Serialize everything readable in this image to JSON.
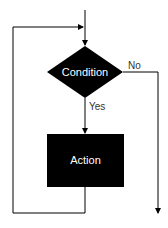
{
  "diagram": {
    "type": "flowchart",
    "nodes": [
      {
        "id": "condition",
        "shape": "diamond",
        "label": "Condition"
      },
      {
        "id": "action",
        "shape": "rectangle",
        "label": "Action"
      }
    ],
    "edges": [
      {
        "from": "entry",
        "to": "condition",
        "label": ""
      },
      {
        "from": "condition",
        "to": "action",
        "label": "Yes"
      },
      {
        "from": "condition",
        "to": "exit",
        "label": "No"
      },
      {
        "from": "action",
        "to": "condition",
        "label": "",
        "kind": "loop-back"
      }
    ],
    "colors": {
      "node_fill": "#000000",
      "node_text": "#ffffff",
      "line": "#000000",
      "edge_text": "#333333"
    }
  }
}
